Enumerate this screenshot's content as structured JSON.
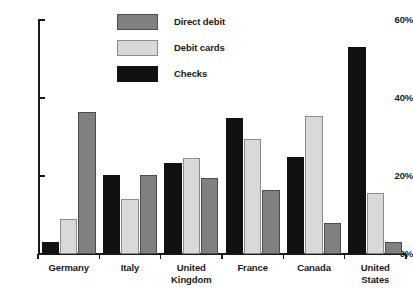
{
  "chart_data": {
    "type": "bar",
    "title": "",
    "subtitle": "",
    "xlabel": "",
    "ylabel": "",
    "ylim": [
      0,
      60
    ],
    "yticks": [
      0,
      20,
      40,
      60
    ],
    "ytick_labels": [
      "0%",
      "20%",
      "40%",
      "60%"
    ],
    "grid": false,
    "legend_position": "top-center",
    "categories": [
      "Germany",
      "Italy",
      "United Kingdom",
      "France",
      "Canada",
      "United States"
    ],
    "category_lines": [
      [
        "Germany"
      ],
      [
        "Italy"
      ],
      [
        "United",
        "Kingdom"
      ],
      [
        "France"
      ],
      [
        "Canada"
      ],
      [
        "United",
        "States"
      ]
    ],
    "series": [
      {
        "name": "Checks",
        "color": "#111111",
        "values": [
          3.0,
          20.3,
          23.3,
          35.0,
          25.0,
          53.0
        ]
      },
      {
        "name": "Debit cards",
        "color": "#d9d9d9",
        "values": [
          9.0,
          14.0,
          24.5,
          29.5,
          35.5,
          15.7
        ]
      },
      {
        "name": "Direct debit",
        "color": "#808080",
        "values": [
          36.5,
          20.3,
          19.5,
          16.5,
          8.0,
          3.0
        ]
      }
    ],
    "series_draw_order": [
      "Checks",
      "Debit cards",
      "Direct debit"
    ],
    "legend_order": [
      "Direct debit",
      "Debit cards",
      "Checks"
    ]
  },
  "legend": {
    "items": [
      {
        "label": "Direct debit",
        "key": "direct-debit"
      },
      {
        "label": "Debit cards",
        "key": "debit-cards"
      },
      {
        "label": "Checks",
        "key": "checks"
      }
    ]
  },
  "colors": {
    "direct_debit": "#808080",
    "debit_cards": "#d9d9d9",
    "checks": "#111111",
    "axis": "#1a1a1a",
    "background": "#ffffff"
  }
}
